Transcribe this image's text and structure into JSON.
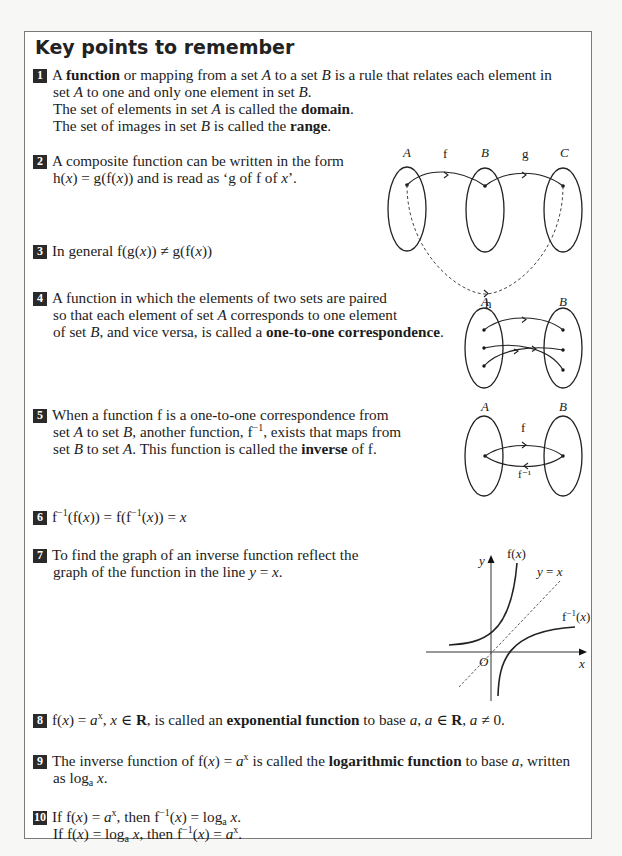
{
  "page": {
    "title": "Key points to remember"
  },
  "points": [
    {
      "number": "1",
      "lines": [
        [
          "A ",
          {
            "b": "function"
          },
          " or mapping from a set ",
          {
            "i": "A"
          },
          " to a set ",
          {
            "i": "B"
          },
          " is a rule that relates each element in"
        ],
        [
          "set ",
          {
            "i": "A"
          },
          " to one and only one element in set ",
          {
            "i": "B"
          },
          "."
        ],
        [
          "The set of elements in set ",
          {
            "i": "A"
          },
          " is called the ",
          {
            "b": "domain"
          },
          "."
        ],
        [
          "The set of images in set ",
          {
            "i": "B"
          },
          " is called the ",
          {
            "b": "range"
          },
          "."
        ]
      ]
    },
    {
      "number": "2",
      "lines": [
        [
          "A composite function can be written in the form"
        ],
        [
          "h(",
          {
            "i": "x"
          },
          ") = g(f(",
          {
            "i": "x"
          },
          ")) and is read as ‘g of f of ",
          {
            "i": "x"
          },
          "’."
        ]
      ]
    },
    {
      "number": "3",
      "lines": [
        [
          "In general f(g(",
          {
            "i": "x"
          },
          ")) ≠ g(f(",
          {
            "i": "x"
          },
          "))"
        ]
      ]
    },
    {
      "number": "4",
      "lines": [
        [
          "A function in which the elements of two sets are paired"
        ],
        [
          "so that each element of set ",
          {
            "i": "A"
          },
          " corresponds to one element"
        ],
        [
          "of set ",
          {
            "i": "B"
          },
          ", and vice versa, is called a ",
          {
            "b": "one-to-one correspondence"
          },
          "."
        ]
      ]
    },
    {
      "number": "5",
      "lines": [
        [
          "When a function f is a one-to-one correspondence from"
        ],
        [
          "set ",
          {
            "i": "A"
          },
          " to set ",
          {
            "i": "B"
          },
          ", another function, f",
          {
            "sup": "−1"
          },
          ", exists that maps from"
        ],
        [
          "set ",
          {
            "i": "B"
          },
          " to set ",
          {
            "i": "A"
          },
          ". This function is called the ",
          {
            "b": "inverse"
          },
          " of f."
        ]
      ]
    },
    {
      "number": "6",
      "lines": [
        [
          "f",
          {
            "sup": "−1"
          },
          "(f(",
          {
            "i": "x"
          },
          ")) = f(f",
          {
            "sup": "−1"
          },
          "(",
          {
            "i": "x"
          },
          ")) = ",
          {
            "i": "x"
          }
        ]
      ]
    },
    {
      "number": "7",
      "lines": [
        [
          "To find the graph of an inverse function reflect the"
        ],
        [
          "graph of the function in the line ",
          {
            "i": "y"
          },
          " = ",
          {
            "i": "x"
          },
          "."
        ]
      ]
    },
    {
      "number": "8",
      "lines": [
        [
          "f(",
          {
            "i": "x"
          },
          ") = ",
          {
            "i": "a"
          },
          {
            "sup": "x"
          },
          ", ",
          {
            "i": "x"
          },
          " ∈ ",
          {
            "b": "R"
          },
          ", is called an ",
          {
            "b": "exponential function"
          },
          " to base ",
          {
            "i": "a"
          },
          ", ",
          {
            "i": "a"
          },
          " ∈ ",
          {
            "b": "R"
          },
          ", ",
          {
            "i": "a"
          },
          " ≠ 0."
        ]
      ]
    },
    {
      "number": "9",
      "lines": [
        [
          "The inverse function of f(",
          {
            "i": "x"
          },
          ") = ",
          {
            "i": "a"
          },
          {
            "sup": "x"
          },
          " is called the ",
          {
            "b": "logarithmic function"
          },
          " to base ",
          {
            "i": "a"
          },
          ", written"
        ],
        [
          "as log",
          {
            "sub": "a"
          },
          " ",
          {
            "i": "x"
          },
          "."
        ]
      ]
    },
    {
      "number": "10",
      "lines": [
        [
          "If f(",
          {
            "i": "x"
          },
          ") = ",
          {
            "i": "a"
          },
          {
            "sup": "x"
          },
          ", then f",
          {
            "sup": "−1"
          },
          "(",
          {
            "i": "x"
          },
          ") = log",
          {
            "sub": "a"
          },
          " ",
          {
            "i": "x"
          },
          "."
        ],
        [
          "If f(",
          {
            "i": "x"
          },
          ") = log",
          {
            "sub": "a"
          },
          " ",
          {
            "i": "x"
          },
          ", then f",
          {
            "sup": "−1"
          },
          "(",
          {
            "i": "x"
          },
          ") = ",
          {
            "i": "a"
          },
          {
            "sup": "x"
          },
          "."
        ]
      ]
    }
  ],
  "diagrams": {
    "composite": {
      "set_labels": [
        "A",
        "B",
        "C"
      ],
      "arrow_labels": {
        "f": "f",
        "g": "g",
        "h": "h"
      }
    },
    "one_to_one": {
      "set_labels": [
        "A",
        "B"
      ]
    },
    "inverse": {
      "set_labels": [
        "A",
        "B"
      ],
      "arrow_labels": {
        "forward": "f",
        "backward": "f⁻¹"
      }
    },
    "graph": {
      "axis_labels": {
        "y": "y",
        "x": "x",
        "origin": "O"
      },
      "curve_labels": {
        "f": "f(x)",
        "finv": "f⁻¹(x)",
        "line": "y = x"
      }
    }
  }
}
